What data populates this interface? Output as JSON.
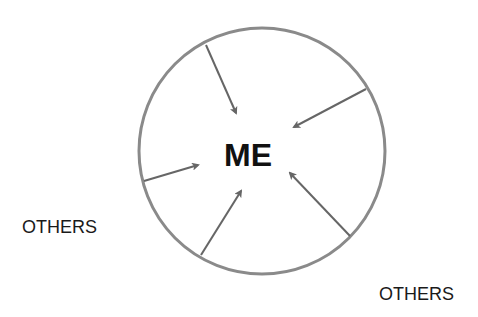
{
  "diagram": {
    "center_label": "ME",
    "outer_labels": [
      {
        "id": "others-left",
        "text": "OTHERS"
      },
      {
        "id": "others-right",
        "text": "OTHERS"
      }
    ],
    "circle": {
      "cx": 262,
      "cy": 151,
      "r": 123,
      "stroke": "#8a8a8a",
      "stroke_width": 3
    },
    "arrow_color": "#666666",
    "arrows": [
      {
        "from": [
          206,
          45
        ],
        "to": [
          236,
          113
        ]
      },
      {
        "from": [
          366,
          89
        ],
        "to": [
          294,
          127
        ]
      },
      {
        "from": [
          144,
          181
        ],
        "to": [
          198,
          165
        ]
      },
      {
        "from": [
          201,
          255
        ],
        "to": [
          241,
          191
        ]
      },
      {
        "from": [
          350,
          236
        ],
        "to": [
          290,
          173
        ]
      }
    ]
  }
}
